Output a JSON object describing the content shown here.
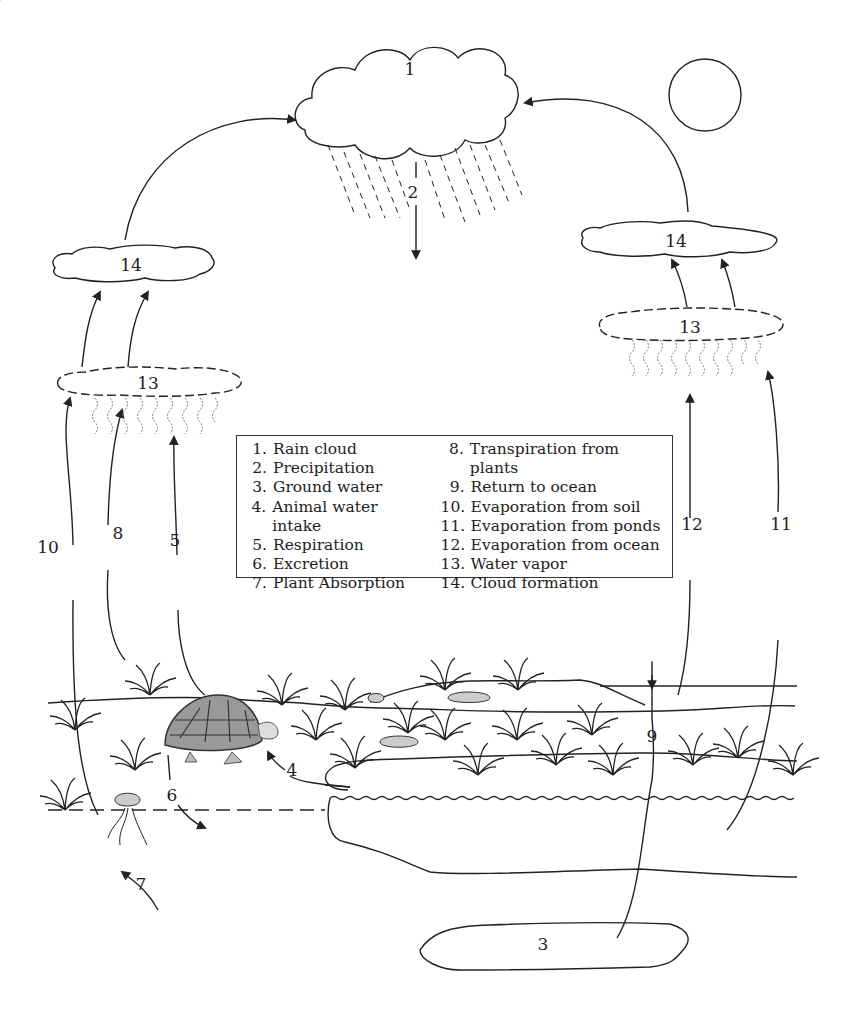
{
  "diagram": {
    "labels": {
      "rain_cloud": "1",
      "precipitation": "2",
      "ground_water": "3",
      "animal_water_intake": "4",
      "respiration": "5",
      "excretion": "6",
      "plant_absorption": "7",
      "transpiration": "8",
      "return_to_ocean": "9",
      "evap_soil": "10",
      "evap_ponds": "11",
      "evap_ocean": "12",
      "water_vapor_left": "13",
      "water_vapor_right": "13",
      "cloud_formation_left": "14",
      "cloud_formation_right": "14"
    },
    "legend": {
      "left": [
        {
          "num": "1.",
          "text": "Rain cloud"
        },
        {
          "num": "2.",
          "text": "Precipitation"
        },
        {
          "num": "3.",
          "text": "Ground water"
        },
        {
          "num": "4.",
          "text": "Animal water intake"
        },
        {
          "num": "5.",
          "text": "Respiration"
        },
        {
          "num": "6.",
          "text": "Excretion"
        },
        {
          "num": "7.",
          "text": "Plant Absorption"
        }
      ],
      "right": [
        {
          "num": "8.",
          "text": "Transpiration from plants"
        },
        {
          "num": "9.",
          "text": "Return to ocean"
        },
        {
          "num": "10.",
          "text": "Evaporation from soil"
        },
        {
          "num": "11.",
          "text": "Evaporation from ponds"
        },
        {
          "num": "12.",
          "text": "Evaporation from ocean"
        },
        {
          "num": "13.",
          "text": "Water vapor"
        },
        {
          "num": "14.",
          "text": "Cloud formation"
        }
      ]
    },
    "colors": {
      "line": "#222222",
      "shell": "#999999",
      "vapor": "#777777"
    }
  }
}
